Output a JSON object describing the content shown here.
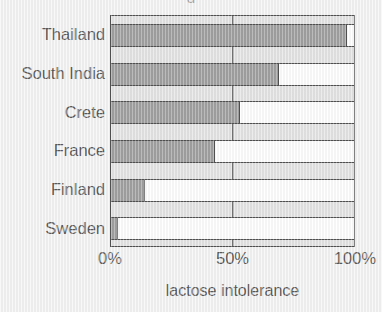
{
  "chart_data": {
    "type": "bar",
    "orientation": "horizontal",
    "title": "",
    "title_fragment": "g",
    "categories": [
      "Thailand",
      "South India",
      "Crete",
      "France",
      "Finland",
      "Sweden"
    ],
    "values": [
      97,
      69,
      53,
      43,
      14,
      3
    ],
    "series": [
      {
        "name": "lactose intolerance",
        "values": [
          97,
          69,
          53,
          43,
          14,
          3
        ]
      }
    ],
    "xlabel": "lactose intolerance",
    "ylabel": "",
    "xlim": [
      0,
      100
    ],
    "xticks": [
      0,
      50,
      100
    ],
    "xtick_labels": [
      "0%",
      "50%",
      "100%"
    ],
    "units": "percent",
    "grid": "vertical-at-50",
    "legend": "none",
    "colors": {
      "bar_fill": "#7f7f7f",
      "bar_remainder": "#ffffff",
      "plot_background": "#dcdcdc",
      "outline": "#111111",
      "page_background": "#f2f2f2",
      "text": "#1e1e1e"
    }
  },
  "axis": {
    "x_title": "lactose intolerance",
    "ticks": [
      {
        "label": "0%",
        "value": 0
      },
      {
        "label": "50%",
        "value": 50
      },
      {
        "label": "100%",
        "value": 100
      }
    ]
  },
  "bars": [
    {
      "label": "Thailand",
      "value": 97
    },
    {
      "label": "South India",
      "value": 69
    },
    {
      "label": "Crete",
      "value": 53
    },
    {
      "label": "France",
      "value": 43
    },
    {
      "label": "Finland",
      "value": 14
    },
    {
      "label": "Sweden",
      "value": 3
    }
  ]
}
